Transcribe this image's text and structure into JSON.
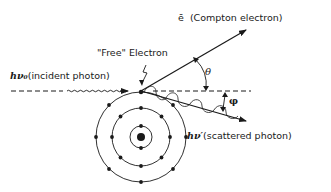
{
  "diagram": {
    "labels": {
      "compton_electron_symbol": "ē",
      "compton_electron": "(Compton electron)",
      "free_electron": "\"Free\" Electron",
      "incident_symbol": "hν₀",
      "incident": "(incident photon)",
      "scattered_symbol": "hν′",
      "scattered": "(scattered photon)",
      "theta": "θ",
      "phi": "φ"
    },
    "atom": {
      "nucleus": "nucleus",
      "shells": [
        {
          "name": "K shell",
          "electrons": 2
        },
        {
          "name": "L shell",
          "electrons": 8
        },
        {
          "name": "M shell",
          "electrons": 8
        }
      ]
    },
    "colors": {
      "ink": "#1a1a1a",
      "background": "#ffffff"
    }
  }
}
